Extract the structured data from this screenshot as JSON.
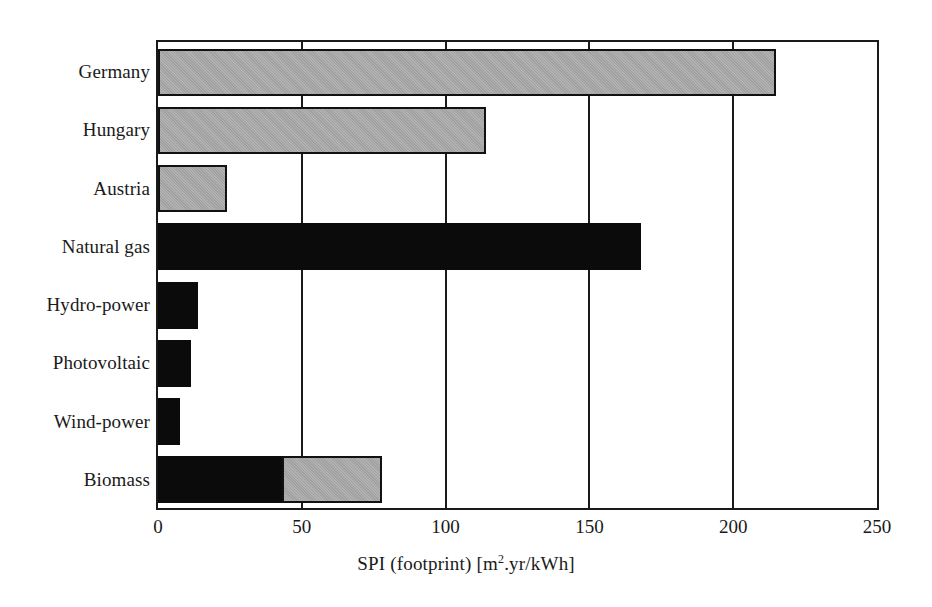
{
  "chart_data": {
    "type": "bar",
    "orientation": "horizontal",
    "title": "",
    "xlabel": "SPI (footprint) [m2.yr/kWh]",
    "ylabel": "",
    "xlim": [
      0,
      250
    ],
    "xticks": [
      0,
      50,
      100,
      150,
      200,
      250
    ],
    "xtick_labels": [
      "0",
      "50",
      "100",
      "150",
      "200",
      "250"
    ],
    "grid": "vertical gridlines at each x tick",
    "legend": "none",
    "categories": [
      "Germany",
      "Hungary",
      "Austria",
      "Natural gas",
      "Hydro-power",
      "Photovoltaic",
      "Wind-power",
      "Biomass"
    ],
    "values": [
      215,
      114,
      24,
      168,
      14,
      11.5,
      7.5,
      78
    ],
    "series": [
      {
        "name": "dark segment",
        "color": "#0b0b0b",
        "values": [
          0,
          0,
          0,
          168,
          14,
          11.5,
          7.5,
          43
        ]
      },
      {
        "name": "grey segment",
        "color": "#a9a9a9",
        "values": [
          215,
          114,
          24,
          0,
          0,
          0,
          0,
          35
        ]
      }
    ],
    "bars": [
      {
        "category": "Germany",
        "total": 215,
        "dark": 0,
        "grey": 215,
        "style": "grey"
      },
      {
        "category": "Hungary",
        "total": 114,
        "dark": 0,
        "grey": 114,
        "style": "grey"
      },
      {
        "category": "Austria",
        "total": 24,
        "dark": 0,
        "grey": 24,
        "style": "grey"
      },
      {
        "category": "Natural gas",
        "total": 168,
        "dark": 168,
        "grey": 0,
        "style": "black"
      },
      {
        "category": "Hydro-power",
        "total": 14,
        "dark": 14,
        "grey": 0,
        "style": "black"
      },
      {
        "category": "Photovoltaic",
        "total": 11.5,
        "dark": 11.5,
        "grey": 0,
        "style": "black"
      },
      {
        "category": "Wind-power",
        "total": 7.5,
        "dark": 7.5,
        "grey": 0,
        "style": "black"
      },
      {
        "category": "Biomass",
        "total": 78,
        "dark": 43,
        "grey": 35,
        "style": "stacked"
      }
    ]
  },
  "axis": {
    "x_title_main": "SPI (footprint) [m",
    "x_title_sup": "2",
    "x_title_tail": ".yr/kWh]"
  },
  "colors": {
    "grey_bar": "#a9a9a9",
    "black_bar": "#0b0b0b",
    "axis": "#1a1a1a",
    "background": "#ffffff"
  }
}
